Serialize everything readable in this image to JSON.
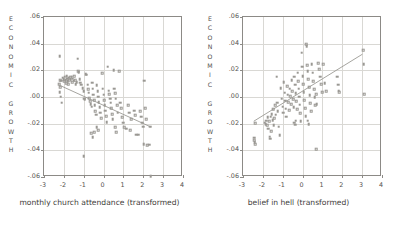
{
  "figure": {
    "background": "#ffffff",
    "marker_color": "#9a9893",
    "line_color": "#9a9893",
    "axis_color": "#8c8a86",
    "grid_color": "#d9d8d4",
    "y_axis_title_letters": [
      "E",
      "C",
      "O",
      "N",
      "O",
      "M",
      "I",
      "C",
      "",
      "G",
      "R",
      "O",
      "W",
      "T",
      "H"
    ],
    "y_axis_title_text": "ECONOMIC GROWTH"
  },
  "chart_data": [
    {
      "type": "scatter",
      "panel": "left",
      "title": "",
      "xlabel": "monthly church attendance (transformed)",
      "ylabel": "ECONOMIC GROWTH",
      "xlim": [
        -3,
        4
      ],
      "ylim": [
        -0.06,
        0.06
      ],
      "xticks": [
        -3,
        -2,
        -1,
        0,
        1,
        2,
        3,
        4
      ],
      "xticklabels": [
        "-3",
        "-2",
        "-1",
        "0",
        "1",
        "2",
        "3",
        "4"
      ],
      "yticks": [
        0.06,
        0.04,
        0.02,
        0.0,
        -0.02,
        -0.04,
        -0.06
      ],
      "yticklabels": [
        ".06",
        ".04",
        ".02",
        ".00",
        "-.02",
        "-.04",
        "-.06"
      ],
      "grid": true,
      "legend": "none",
      "fit_line": {
        "x0": -2.25,
        "y0": 0.0085,
        "x1": 2.45,
        "y1": -0.0235
      },
      "points": [
        [
          -2.2,
          0.0305
        ],
        [
          -2.18,
          0.0128
        ],
        [
          -2.12,
          0.0122
        ],
        [
          -2.22,
          0.0098
        ],
        [
          -2.18,
          0.0072
        ],
        [
          -2.2,
          0.0035
        ],
        [
          -2.16,
          0.0002
        ],
        [
          -2.1,
          -0.0042
        ],
        [
          -2.05,
          0.0145
        ],
        [
          -2.0,
          0.0135
        ],
        [
          -1.98,
          0.0118
        ],
        [
          -1.95,
          0.0152
        ],
        [
          -1.9,
          0.0128
        ],
        [
          -1.88,
          0.0105
        ],
        [
          -1.85,
          0.0158
        ],
        [
          -1.82,
          0.0138
        ],
        [
          -1.8,
          0.0118
        ],
        [
          -1.78,
          0.0095
        ],
        [
          -1.75,
          0.0145
        ],
        [
          -1.72,
          0.0125
        ],
        [
          -1.68,
          0.0148
        ],
        [
          -1.65,
          0.0132
        ],
        [
          -1.6,
          0.0152
        ],
        [
          -1.58,
          0.0112
        ],
        [
          -1.55,
          0.0138
        ],
        [
          -1.5,
          0.0122
        ],
        [
          -1.48,
          0.0158
        ],
        [
          -1.42,
          0.0128
        ],
        [
          -1.4,
          0.0098
        ],
        [
          -1.35,
          0.0112
        ],
        [
          -1.3,
          0.0288
        ],
        [
          -1.28,
          0.0192
        ],
        [
          -1.25,
          0.0188
        ],
        [
          -1.2,
          0.0135
        ],
        [
          -1.18,
          0.0108
        ],
        [
          -1.12,
          0.0092
        ],
        [
          -1.05,
          0.0068
        ],
        [
          -1.0,
          0.0042
        ],
        [
          -0.98,
          -0.0012
        ],
        [
          -0.95,
          -0.0018
        ],
        [
          -0.9,
          0.0172
        ],
        [
          -0.85,
          0.0168
        ],
        [
          -0.8,
          0.0092
        ],
        [
          -0.78,
          0.0058
        ],
        [
          -0.75,
          0.0032
        ],
        [
          -0.72,
          -0.0008
        ],
        [
          -0.68,
          -0.0032
        ],
        [
          -0.65,
          -0.0052
        ],
        [
          -0.6,
          -0.0072
        ],
        [
          -0.58,
          0.0108
        ],
        [
          -0.55,
          0.0062
        ],
        [
          -0.52,
          0.0018
        ],
        [
          -0.48,
          -0.0022
        ],
        [
          -0.45,
          -0.0062
        ],
        [
          -0.42,
          -0.0108
        ],
        [
          -0.38,
          -0.0132
        ],
        [
          -0.35,
          0.0088
        ],
        [
          -0.3,
          0.0042
        ],
        [
          -0.28,
          0.0002
        ],
        [
          -0.25,
          -0.0038
        ],
        [
          -0.2,
          -0.0078
        ],
        [
          -0.18,
          -0.0118
        ],
        [
          -0.12,
          -0.0158
        ],
        [
          -0.08,
          0.0178
        ],
        [
          -0.05,
          0.0062
        ],
        [
          0.0,
          0.0018
        ],
        [
          0.02,
          -0.0022
        ],
        [
          0.05,
          -0.0062
        ],
        [
          0.08,
          -0.0102
        ],
        [
          0.12,
          -0.0142
        ],
        [
          0.15,
          -0.0188
        ],
        [
          0.2,
          0.0228
        ],
        [
          0.25,
          0.0048
        ],
        [
          0.28,
          0.0022
        ],
        [
          0.32,
          -0.0012
        ],
        [
          0.35,
          -0.0042
        ],
        [
          0.38,
          -0.0082
        ],
        [
          0.42,
          -0.0128
        ],
        [
          0.45,
          -0.0168
        ],
        [
          0.5,
          0.0202
        ],
        [
          0.55,
          0.0062
        ],
        [
          0.58,
          0.0028
        ],
        [
          0.62,
          -0.0012
        ],
        [
          0.68,
          -0.0062
        ],
        [
          0.72,
          -0.0118
        ],
        [
          0.8,
          0.0192
        ],
        [
          0.85,
          -0.0042
        ],
        [
          0.9,
          -0.0082
        ],
        [
          0.95,
          -0.0152
        ],
        [
          1.0,
          -0.0192
        ],
        [
          1.05,
          -0.0228
        ],
        [
          1.15,
          -0.0238
        ],
        [
          1.25,
          -0.0062
        ],
        [
          1.3,
          -0.0118
        ],
        [
          1.35,
          -0.0248
        ],
        [
          1.55,
          -0.0102
        ],
        [
          1.6,
          -0.0138
        ],
        [
          1.65,
          -0.0282
        ],
        [
          1.75,
          -0.0282
        ],
        [
          1.85,
          -0.0108
        ],
        [
          1.9,
          -0.0148
        ],
        [
          1.95,
          -0.0192
        ],
        [
          2.0,
          -0.0222
        ],
        [
          2.02,
          -0.0352
        ],
        [
          2.05,
          0.0122
        ],
        [
          2.1,
          -0.0082
        ],
        [
          2.15,
          -0.0168
        ],
        [
          2.2,
          -0.0362
        ],
        [
          2.3,
          -0.0358
        ],
        [
          2.35,
          -0.0222
        ],
        [
          2.38,
          -0.0592
        ],
        [
          -1.0,
          -0.0442
        ],
        [
          -0.62,
          -0.0272
        ],
        [
          -0.55,
          -0.0302
        ],
        [
          -0.48,
          -0.0262
        ],
        [
          -0.35,
          -0.0228
        ],
        [
          -0.28,
          -0.0248
        ],
        [
          0.6,
          -0.0228
        ],
        [
          0.65,
          -0.0262
        ],
        [
          1.4,
          -0.0168
        ]
      ]
    },
    {
      "type": "scatter",
      "panel": "right",
      "title": "",
      "xlabel": "belief in hell (transformed)",
      "ylabel": "ECONOMIC GROWTH",
      "xlim": [
        -3,
        4
      ],
      "ylim": [
        -0.06,
        0.06
      ],
      "xticks": [
        -3,
        -2,
        -1,
        0,
        1,
        2,
        3,
        4
      ],
      "xticklabels": [
        "-3",
        "-2",
        "-1",
        "0",
        "1",
        "2",
        "3",
        "4"
      ],
      "yticks": [
        0.06,
        0.04,
        0.02,
        0.0,
        -0.02,
        -0.04,
        -0.06
      ],
      "yticklabels": [
        ".06",
        ".04",
        ".02",
        ".00",
        "-.02",
        "-.04",
        "-.06"
      ],
      "grid": true,
      "legend": "none",
      "fit_line": {
        "x0": -2.45,
        "y0": -0.0192,
        "x1": 3.1,
        "y1": 0.0318
      },
      "points": [
        [
          -2.45,
          -0.0305
        ],
        [
          -2.45,
          -0.0322
        ],
        [
          -2.42,
          -0.0338
        ],
        [
          -2.4,
          -0.0198
        ],
        [
          -2.38,
          -0.0352
        ],
        [
          -1.9,
          -0.0192
        ],
        [
          -1.85,
          -0.0202
        ],
        [
          -1.82,
          -0.0178
        ],
        [
          -1.78,
          -0.0212
        ],
        [
          -1.75,
          -0.0152
        ],
        [
          -1.72,
          -0.0238
        ],
        [
          -1.68,
          -0.0182
        ],
        [
          -1.65,
          -0.0298
        ],
        [
          -1.62,
          -0.0312
        ],
        [
          -1.6,
          -0.0148
        ],
        [
          -1.58,
          -0.0258
        ],
        [
          -1.55,
          -0.0128
        ],
        [
          -1.5,
          -0.0172
        ],
        [
          -1.48,
          -0.0092
        ],
        [
          -1.42,
          -0.0158
        ],
        [
          -1.38,
          -0.0062
        ],
        [
          -1.35,
          -0.0132
        ],
        [
          -1.3,
          0.0152
        ],
        [
          -1.28,
          -0.0042
        ],
        [
          -1.25,
          -0.0108
        ],
        [
          -1.2,
          -0.0222
        ],
        [
          -1.15,
          -0.0288
        ],
        [
          -1.1,
          0.0068
        ],
        [
          -1.05,
          -0.0012
        ],
        [
          -1.0,
          -0.0072
        ],
        [
          -0.98,
          -0.0118
        ],
        [
          -0.95,
          0.0112
        ],
        [
          -0.9,
          0.0032
        ],
        [
          -0.88,
          -0.0028
        ],
        [
          -0.85,
          -0.0088
        ],
        [
          -0.82,
          -0.0148
        ],
        [
          -0.78,
          0.0082
        ],
        [
          -0.75,
          0.0018
        ],
        [
          -0.72,
          -0.0038
        ],
        [
          -0.68,
          -0.0098
        ],
        [
          -0.65,
          0.0062
        ],
        [
          -0.62,
          0.0008
        ],
        [
          -0.58,
          -0.0052
        ],
        [
          -0.55,
          0.0128
        ],
        [
          -0.52,
          0.0042
        ],
        [
          -0.48,
          -0.0018
        ],
        [
          -0.45,
          -0.0078
        ],
        [
          -0.42,
          0.0152
        ],
        [
          -0.38,
          0.0092
        ],
        [
          -0.35,
          0.0028
        ],
        [
          -0.32,
          -0.0032
        ],
        [
          -0.28,
          -0.0092
        ],
        [
          -0.25,
          0.0182
        ],
        [
          -0.22,
          0.0118
        ],
        [
          -0.2,
          0.0062
        ],
        [
          -0.18,
          0.0002
        ],
        [
          -0.15,
          -0.0058
        ],
        [
          -0.12,
          -0.0122
        ],
        [
          -0.1,
          -0.0182
        ],
        [
          -0.05,
          0.0332
        ],
        [
          -0.02,
          0.0228
        ],
        [
          0.0,
          0.0158
        ],
        [
          0.02,
          0.0098
        ],
        [
          0.05,
          0.0038
        ],
        [
          0.08,
          -0.0022
        ],
        [
          0.12,
          -0.0082
        ],
        [
          0.15,
          -0.0142
        ],
        [
          0.18,
          0.0398
        ],
        [
          0.2,
          0.0382
        ],
        [
          0.22,
          0.0238
        ],
        [
          0.25,
          0.0192
        ],
        [
          0.28,
          0.0132
        ],
        [
          0.32,
          0.0072
        ],
        [
          0.35,
          0.0012
        ],
        [
          0.38,
          -0.0048
        ],
        [
          0.42,
          -0.0108
        ],
        [
          0.45,
          0.0248
        ],
        [
          0.5,
          0.0182
        ],
        [
          0.55,
          0.0118
        ],
        [
          0.58,
          0.0058
        ],
        [
          0.62,
          -0.0002
        ],
        [
          0.65,
          -0.0062
        ],
        [
          0.7,
          -0.0392
        ],
        [
          0.8,
          0.0252
        ],
        [
          0.85,
          0.0208
        ],
        [
          0.9,
          0.0152
        ],
        [
          0.95,
          0.0098
        ],
        [
          1.0,
          0.0038
        ],
        [
          1.05,
          0.0248
        ],
        [
          1.12,
          0.0102
        ],
        [
          1.18,
          0.0042
        ],
        [
          1.75,
          0.0152
        ],
        [
          1.8,
          0.0092
        ],
        [
          1.82,
          0.0048
        ],
        [
          1.85,
          0.0038
        ],
        [
          3.05,
          0.0352
        ],
        [
          3.08,
          0.0248
        ],
        [
          3.1,
          0.0022
        ],
        [
          -0.42,
          -0.0192
        ],
        [
          -0.38,
          -0.0208
        ],
        [
          -0.35,
          -0.0178
        ],
        [
          -1.45,
          -0.0212
        ],
        [
          0.25,
          -0.0178
        ],
        [
          0.3,
          -0.0202
        ],
        [
          0.68,
          0.0022
        ],
        [
          0.72,
          -0.0052
        ]
      ]
    }
  ]
}
